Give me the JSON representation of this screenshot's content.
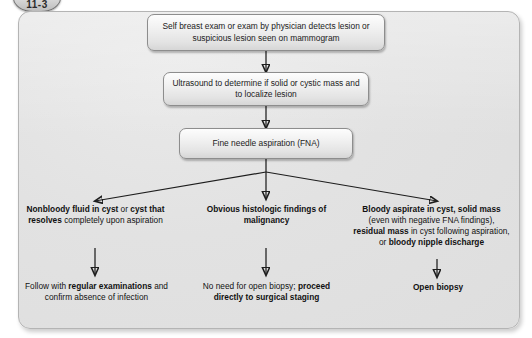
{
  "badge": {
    "label": "11-3"
  },
  "diagram": {
    "type": "flowchart",
    "nodes": [
      {
        "id": "n1",
        "label": "Self breast exam or exam by physician detects lesion or suspicious lesion seen on mammogram",
        "shape": "rounded-box"
      },
      {
        "id": "n2",
        "label": "Ultrasound to determine if solid or cystic mass and to localize lesion",
        "shape": "rounded-box"
      },
      {
        "id": "n3",
        "label": "Fine needle aspiration (FNA)",
        "shape": "rounded-box"
      }
    ],
    "branches": [
      {
        "id": "b1",
        "position": "left",
        "finding_runs": [
          {
            "text": "Nonbloody fluid in cyst",
            "bold": true
          },
          {
            "text": " or ",
            "bold": false
          },
          {
            "text": "cyst that resolves",
            "bold": true
          },
          {
            "text": " completely upon aspiration",
            "bold": false
          }
        ],
        "outcome_runs": [
          {
            "text": "Follow with ",
            "bold": false
          },
          {
            "text": "regular examinations",
            "bold": true
          },
          {
            "text": " and confirm absence of infection",
            "bold": false
          }
        ]
      },
      {
        "id": "b2",
        "position": "center",
        "finding_runs": [
          {
            "text": "Obvious histologic findings of malignancy",
            "bold": true
          }
        ],
        "outcome_runs": [
          {
            "text": "No need for open biopsy; ",
            "bold": false
          },
          {
            "text": "proceed directly to surgical staging",
            "bold": true
          }
        ]
      },
      {
        "id": "b3",
        "position": "right",
        "finding_runs": [
          {
            "text": "Bloody aspirate in cyst, solid mass",
            "bold": true
          },
          {
            "text": " (even with negative FNA findings), ",
            "bold": false
          },
          {
            "text": "residual mass",
            "bold": true
          },
          {
            "text": " in cyst following aspiration, or ",
            "bold": false
          },
          {
            "text": "bloody nipple discharge",
            "bold": true
          }
        ],
        "outcome_runs": [
          {
            "text": "Open biopsy",
            "bold": true
          }
        ]
      }
    ]
  }
}
